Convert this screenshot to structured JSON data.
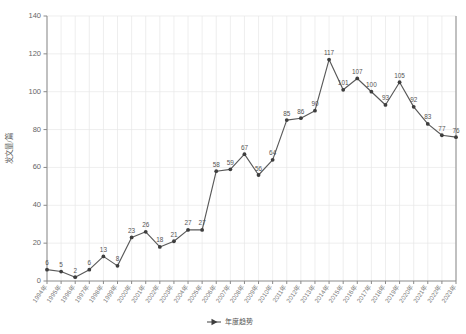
{
  "chart_data": {
    "type": "line",
    "title": "",
    "xlabel": "",
    "ylabel": "发文量/篇",
    "ylim": [
      0,
      140
    ],
    "ytick_step": 20,
    "yticks": [
      0,
      20,
      40,
      60,
      80,
      100,
      120,
      140
    ],
    "grid": true,
    "legend_position": "bottom-center",
    "legend": [
      "年度趋势"
    ],
    "categories": [
      "1994年",
      "1995年",
      "1996年",
      "1997年",
      "1998年",
      "1999年",
      "2000年",
      "2001年",
      "2002年",
      "2003年",
      "2004年",
      "2005年",
      "2006年",
      "2007年",
      "2008年",
      "2009年",
      "2010年",
      "2011年",
      "2012年",
      "2013年",
      "2014年",
      "2015年",
      "2016年",
      "2017年",
      "2018年",
      "2019年",
      "2020年",
      "2021年",
      "2022年",
      "2023年"
    ],
    "series": [
      {
        "name": "年度趋势",
        "color": "#595959",
        "marker": "circle",
        "values": [
          6,
          5,
          2,
          6,
          13,
          8,
          23,
          26,
          18,
          21,
          27,
          27,
          58,
          59,
          67,
          56,
          64,
          85,
          86,
          90,
          117,
          101,
          107,
          100,
          93,
          105,
          92,
          83,
          77,
          76
        ]
      }
    ]
  },
  "colors": {
    "line": "#595959",
    "marker": "#3d3d3d",
    "grid": "#e6e6e6",
    "axis": "#8a8a8a",
    "label_text": "#555555",
    "tick_text": "#666666",
    "background": "#ffffff"
  }
}
